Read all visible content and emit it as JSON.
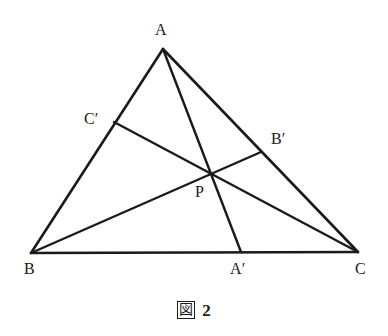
{
  "figure": {
    "caption_mark": "図",
    "caption_number": "2",
    "caption_full": "図 2",
    "stroke_color": "#1a1a1a",
    "background_color": "#ffffff"
  },
  "geometry": {
    "type": "triangle-with-cevians",
    "description": "Triangle ABC with three cevians AA', BB', CC' concurrent at point P",
    "points": {
      "A": {
        "label": "A",
        "x": 163,
        "y": 49,
        "label_x": 155,
        "label_y": 22
      },
      "B": {
        "label": "B",
        "x": 31,
        "y": 253,
        "label_x": 24,
        "label_y": 261
      },
      "C": {
        "label": "C",
        "x": 358,
        "y": 252,
        "label_x": 355,
        "label_y": 261
      },
      "A_prime": {
        "label": "A′",
        "x": 241,
        "y": 252,
        "label_x": 230,
        "label_y": 261
      },
      "B_prime": {
        "label": "B′",
        "x": 261,
        "y": 152,
        "label_x": 271,
        "label_y": 131
      },
      "C_prime": {
        "label": "C′",
        "x": 114,
        "y": 122,
        "label_x": 84,
        "label_y": 111
      },
      "P": {
        "label": "P",
        "x": 211,
        "y": 172,
        "label_x": 195,
        "label_y": 184
      }
    },
    "segments": [
      {
        "name": "side-AB",
        "from": "A",
        "to": "B"
      },
      {
        "name": "side-BC",
        "from": "B",
        "to": "C"
      },
      {
        "name": "side-CA",
        "from": "C",
        "to": "A"
      },
      {
        "name": "cevian-A-to-Aprime",
        "from": "A",
        "to": "A_prime"
      },
      {
        "name": "cevian-B-to-Bprime",
        "from": "B",
        "to": "B_prime"
      },
      {
        "name": "cevian-C-to-Cprime",
        "from": "C",
        "to": "C_prime"
      }
    ]
  }
}
